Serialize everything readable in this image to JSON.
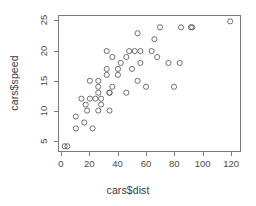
{
  "chart_data": {
    "type": "scatter",
    "title": "",
    "xlabel": "cars$dist",
    "ylabel": "cars$speed",
    "xlim": [
      -2,
      127
    ],
    "ylim": [
      3.2,
      25.9
    ],
    "xticks": [
      0,
      20,
      40,
      60,
      80,
      100,
      120
    ],
    "yticks": [
      5,
      10,
      15,
      20,
      25
    ],
    "xtick_labels": [
      "0",
      "20",
      "40",
      "60",
      "80",
      "100",
      "120"
    ],
    "ytick_labels": [
      "5",
      "10",
      "15",
      "20",
      "25"
    ],
    "grid": false,
    "legend": null,
    "marker": "open-circle",
    "marker_color": "#5e5e5e",
    "background": "#ffffff",
    "box_color": "#7a7a7a",
    "x": [
      2,
      10,
      4,
      22,
      16,
      10,
      18,
      26,
      34,
      17,
      28,
      14,
      20,
      24,
      28,
      26,
      34,
      34,
      46,
      26,
      36,
      60,
      80,
      20,
      26,
      54,
      32,
      40,
      32,
      40,
      50,
      42,
      56,
      76,
      84,
      36,
      46,
      68,
      32,
      48,
      52,
      56,
      64,
      66,
      54,
      70,
      92,
      93,
      120,
      85
    ],
    "y": [
      4,
      7,
      4,
      7,
      8,
      9,
      10,
      10,
      10,
      11,
      11,
      12,
      12,
      12,
      12,
      13,
      13,
      13,
      13,
      14,
      14,
      14,
      14,
      15,
      15,
      15,
      16,
      16,
      17,
      17,
      17,
      18,
      18,
      18,
      18,
      19,
      19,
      19,
      20,
      20,
      20,
      20,
      20,
      22,
      23,
      24,
      24,
      24,
      25,
      24
    ],
    "n_points": 50
  }
}
